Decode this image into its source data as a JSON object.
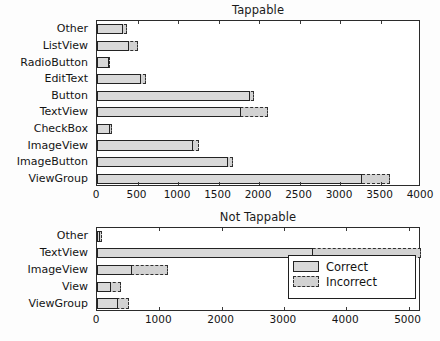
{
  "figure": {
    "background": "#ffffff",
    "correct_color": "#d9d9d9",
    "incorrect_color": "#d2d2d2",
    "edge_color": "#232323"
  },
  "legend": {
    "correct_label": "Correct",
    "incorrect_label": "Incorrect"
  },
  "chart_data": [
    {
      "type": "bar",
      "orientation": "horizontal",
      "title": "Tappable",
      "xlabel": "",
      "ylabel": "",
      "xlim": [
        0,
        4000
      ],
      "xticks": [
        0,
        500,
        1000,
        1500,
        2000,
        2500,
        3000,
        3500,
        4000
      ],
      "xticklabels": [
        "0",
        "500",
        "1000",
        "1500",
        "2000",
        "2500",
        "3000",
        "3500",
        "4000"
      ],
      "grid": false,
      "legend_position": "none",
      "categories": [
        "Other",
        "ListView",
        "RadioButton",
        "EditText",
        "Button",
        "TextView",
        "CheckBox",
        "ImageView",
        "ImageButton",
        "ViewGroup"
      ],
      "series": [
        {
          "name": "Correct",
          "values": [
            320,
            400,
            145,
            545,
            1890,
            1780,
            160,
            1180,
            1620,
            3270
          ]
        },
        {
          "name": "Incorrect",
          "values": [
            370,
            510,
            165,
            610,
            1935,
            2105,
            190,
            1265,
            1680,
            3615
          ]
        }
      ]
    },
    {
      "type": "bar",
      "orientation": "horizontal",
      "title": "Not Tappable",
      "xlabel": "",
      "ylabel": "",
      "xlim": [
        0,
        5200
      ],
      "xticks": [
        0,
        1000,
        2000,
        3000,
        4000,
        5000
      ],
      "xticklabels": [
        "0",
        "1000",
        "2000",
        "3000",
        "4000",
        "5000"
      ],
      "grid": false,
      "legend_position": "center right",
      "categories": [
        "Other",
        "TextView",
        "ImageView",
        "View",
        "ViewGroup"
      ],
      "series": [
        {
          "name": "Correct",
          "values": [
            55,
            3460,
            565,
            225,
            330
          ]
        },
        {
          "name": "Incorrect",
          "values": [
            85,
            5200,
            1145,
            390,
            510
          ]
        }
      ]
    }
  ]
}
